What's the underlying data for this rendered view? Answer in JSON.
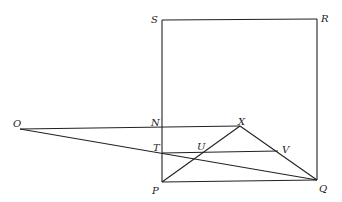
{
  "diagram": {
    "type": "geometry",
    "points": {
      "S": {
        "x": 162,
        "y": 20
      },
      "R": {
        "x": 317,
        "y": 19
      },
      "N": {
        "x": 162,
        "y": 127
      },
      "X": {
        "x": 240,
        "y": 126
      },
      "O": {
        "x": 20,
        "y": 129
      },
      "T": {
        "x": 162,
        "y": 153
      },
      "U": {
        "x": 205,
        "y": 152
      },
      "V": {
        "x": 278,
        "y": 151
      },
      "P": {
        "x": 162,
        "y": 182
      },
      "Q": {
        "x": 317,
        "y": 180
      }
    },
    "labels": [
      {
        "id": "S",
        "text": "S",
        "x": 151,
        "y": 23
      },
      {
        "id": "R",
        "text": "R",
        "x": 321,
        "y": 22
      },
      {
        "id": "O",
        "text": "O",
        "x": 13,
        "y": 127
      },
      {
        "id": "N",
        "text": "N",
        "x": 151,
        "y": 126
      },
      {
        "id": "X",
        "text": "X",
        "x": 238,
        "y": 125
      },
      {
        "id": "T",
        "text": "T",
        "x": 153,
        "y": 151
      },
      {
        "id": "U",
        "text": "U",
        "x": 197,
        "y": 150
      },
      {
        "id": "V",
        "text": "V",
        "x": 282,
        "y": 153
      },
      {
        "id": "P",
        "text": "P",
        "x": 152,
        "y": 194
      },
      {
        "id": "Q",
        "text": "Q",
        "x": 319,
        "y": 192
      }
    ],
    "segments": [
      [
        "S",
        "R"
      ],
      [
        "R",
        "Q"
      ],
      [
        "Q",
        "P"
      ],
      [
        "P",
        "S"
      ],
      [
        "O",
        "X"
      ],
      [
        "O",
        "Q"
      ],
      [
        "T",
        "V"
      ],
      [
        "P",
        "X"
      ],
      [
        "X",
        "Q"
      ]
    ]
  }
}
